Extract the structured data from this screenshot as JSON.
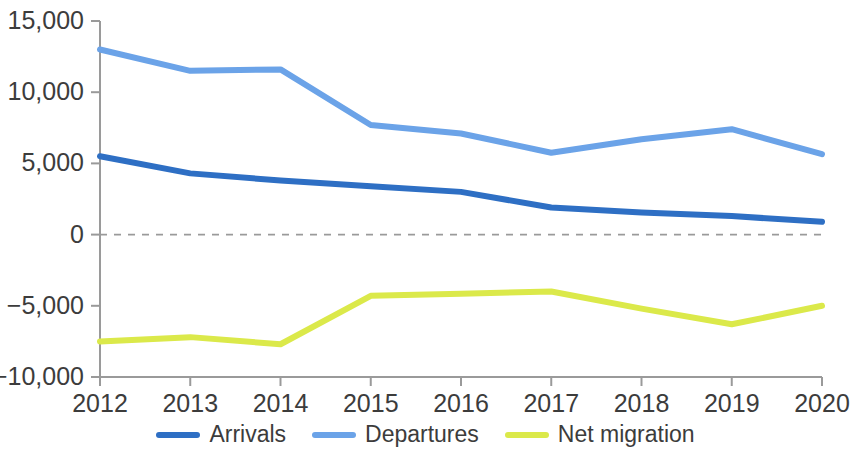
{
  "chart_data": {
    "type": "line",
    "title": "",
    "subtitle": "",
    "xlabel": "",
    "ylabel": "",
    "categories": [
      "2012",
      "2013",
      "2014",
      "2015",
      "2016",
      "2017",
      "2018",
      "2019",
      "2020"
    ],
    "x_tick_labels": [
      "2012",
      "2013",
      "2014",
      "2015",
      "2016",
      "2017",
      "2018",
      "2019",
      "2020"
    ],
    "y_tick_labels": [
      "15,000",
      "10,000",
      "5,000",
      "0",
      "−5,000",
      "−10,000"
    ],
    "y_tick_values": [
      15000,
      10000,
      5000,
      0,
      -5000,
      -10000
    ],
    "ylim": [
      -10000,
      15000
    ],
    "grid": false,
    "zero_line": true,
    "zero_line_style": "dashed",
    "legend_position": "bottom",
    "series": [
      {
        "name": "Arrivals",
        "color": "#2e6fc4",
        "values": [
          5500,
          4300,
          3800,
          3400,
          3000,
          1900,
          1550,
          1300,
          900
        ]
      },
      {
        "name": "Departures",
        "color": "#6ba3e8",
        "values": [
          13000,
          11500,
          11600,
          7700,
          7100,
          5750,
          6700,
          7400,
          5650
        ]
      },
      {
        "name": "Net migration",
        "color": "#dbe94a",
        "values": [
          -7500,
          -7200,
          -7700,
          -4300,
          -4150,
          -4000,
          -5200,
          -6300,
          -5000
        ]
      }
    ]
  },
  "legend": {
    "items": [
      {
        "label": "Arrivals",
        "color": "#2e6fc4"
      },
      {
        "label": "Departures",
        "color": "#6ba3e8"
      },
      {
        "label": "Net migration",
        "color": "#dbe94a"
      }
    ]
  },
  "axes": {
    "y_labels": [
      "15,000",
      "10,000",
      "5,000",
      "0",
      "−5,000",
      "−10,000"
    ],
    "x_labels": [
      "2012",
      "2013",
      "2014",
      "2015",
      "2016",
      "2017",
      "2018",
      "2019",
      "2020"
    ]
  },
  "style": {
    "axis_color": "#9a9a9a",
    "zero_line_color": "#9a9a9a",
    "background": "#ffffff",
    "text_color": "#3c3c3c"
  }
}
